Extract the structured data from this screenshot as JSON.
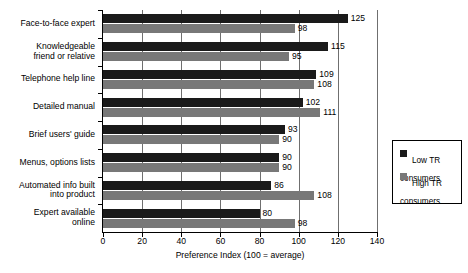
{
  "chart_data": {
    "type": "bar",
    "orientation": "horizontal",
    "title": "",
    "xlabel": "Preference Index (100 = average)",
    "ylabel": "",
    "xlim": [
      0,
      140
    ],
    "xticks": [
      0,
      20,
      40,
      60,
      80,
      100,
      120,
      140
    ],
    "grid": true,
    "grid_axis": "x",
    "legend_position": "right",
    "categories": [
      "Face-to-face expert",
      "Knowledgeable\nfriend or relative",
      "Telephone help line",
      "Detailed manual",
      "Brief users' guide",
      "Menus, options lists",
      "Automated info built\ninto product",
      "Expert available\nonline"
    ],
    "series": [
      {
        "name": "Low TR\nconsumers",
        "color": "#1a1a1a",
        "values": [
          125,
          115,
          109,
          102,
          93,
          90,
          86,
          80
        ]
      },
      {
        "name": "High TR\nconsumers",
        "color": "#787878",
        "values": [
          98,
          95,
          108,
          111,
          90,
          90,
          108,
          98
        ]
      }
    ]
  },
  "axis": {
    "x_title": "Preference Index (100 = average)",
    "x_tick_labels": [
      "0",
      "20",
      "40",
      "60",
      "80",
      "100",
      "120",
      "140"
    ]
  },
  "legend": {
    "items": [
      {
        "label": "Low TR\nconsumers",
        "color": "#1a1a1a"
      },
      {
        "label": "High TR\nconsumers",
        "color": "#787878"
      }
    ]
  },
  "values_low": [
    "125",
    "115",
    "109",
    "102",
    "93",
    "90",
    "86",
    "80"
  ],
  "values_high": [
    "98",
    "95",
    "108",
    "111",
    "90",
    "90",
    "108",
    "98"
  ]
}
